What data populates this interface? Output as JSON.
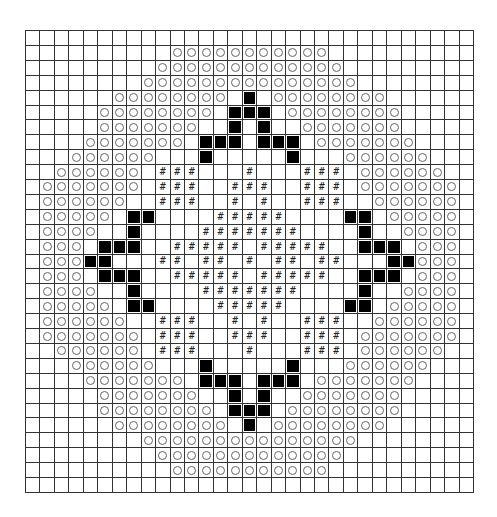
{
  "diagram": {
    "type": "cross-stitch / knitting chart grid",
    "columns": 31,
    "rows_count": 31,
    "legend": {
      ".": "empty",
      "o": "circle",
      "b": "filled-black",
      "#": "hash"
    },
    "hash_glyph": "#",
    "colors": {
      "grid_line": "#333333",
      "block": "#000000",
      "circle": "#666666",
      "background": "#ffffff"
    },
    "rows": [
      "...............................",
      "..........ooooooooooo..........",
      ".........ooooooooooooo.........",
      "........ooooooooooooooo........",
      "......oooooooo.b.oooooooo......",
      ".....oooooooo.bbb.oooooooo.....",
      ".....ooooooo..b.b..ooooooo.....",
      "....ooooooo.bbb.bbb.ooooooo....",
      "...oooooo...b.....b...oooooo...",
      "..oooooo.###...#...###.oooooo..",
      ".ooooooo.###..###..###.ooooooo.",
      ".oooooo..###..#.#..###..oooooo.",
      ".ooooo.bb....#####....bb.ooooo.",
      ".oooo..b....#######....b..oooo.",
      ".ooo.bbb..#####.#####..bbb.ooo.",
      ".ooobb...##.##.#.##.##...bbooo.",
      ".ooo.bbb..#####.#####..bbb.ooo.",
      ".oooo..b....#######....b..oooo.",
      ".ooooo.bb....#####....bb.ooooo.",
      ".oooooo..###..#.#..###..oooooo.",
      ".ooooooo.###..###..###.ooooooo.",
      "..oooooo.###...#...###.oooooo..",
      "...oooooo...b.....b...oooooo...",
      "....ooooooo.bbb.bbb.ooooooo....",
      ".....ooooooo..b.b..ooooooo.....",
      ".....oooooooo.bbb.oooooooo.....",
      "......oooooooo.b.oooooooo......",
      "........ooooooooooooooo........",
      ".........ooooooooooooo.........",
      "..........ooooooooooo..........",
      "..............................."
    ]
  }
}
